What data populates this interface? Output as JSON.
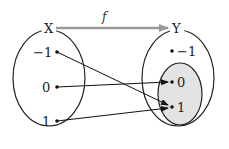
{
  "diagram": {
    "type": "function-mapping",
    "function_label": "f",
    "arrow_color": "#999999",
    "shaded_color": "#e3e3e3",
    "domain": {
      "label": "X",
      "elements": [
        "−1",
        "0",
        "1"
      ]
    },
    "codomain": {
      "label": "Y",
      "elements": [
        "−1",
        "0",
        "1"
      ],
      "range_elements": [
        "0",
        "1"
      ]
    },
    "mappings": [
      {
        "from": "−1",
        "to": "1"
      },
      {
        "from": "0",
        "to": "0"
      },
      {
        "from": "1",
        "to": "1"
      }
    ]
  }
}
